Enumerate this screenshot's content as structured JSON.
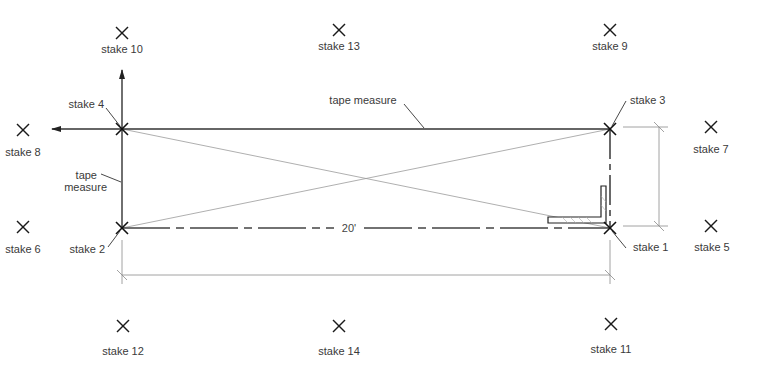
{
  "diagram": {
    "stakes": [
      {
        "id": "stake-1",
        "label": "stake 1",
        "role": "corner"
      },
      {
        "id": "stake-2",
        "label": "stake 2",
        "role": "corner"
      },
      {
        "id": "stake-3",
        "label": "stake 3",
        "role": "corner"
      },
      {
        "id": "stake-4",
        "label": "stake 4",
        "role": "corner"
      },
      {
        "id": "stake-5",
        "label": "stake 5",
        "role": "batter"
      },
      {
        "id": "stake-6",
        "label": "stake 6",
        "role": "batter"
      },
      {
        "id": "stake-7",
        "label": "stake 7",
        "role": "batter"
      },
      {
        "id": "stake-8",
        "label": "stake 8",
        "role": "batter"
      },
      {
        "id": "stake-9",
        "label": "stake 9",
        "role": "batter"
      },
      {
        "id": "stake-10",
        "label": "stake 10",
        "role": "batter"
      },
      {
        "id": "stake-11",
        "label": "stake 11",
        "role": "batter"
      },
      {
        "id": "stake-12",
        "label": "stake 12",
        "role": "batter"
      },
      {
        "id": "stake-13",
        "label": "stake 13",
        "role": "batter"
      },
      {
        "id": "stake-14",
        "label": "stake 14",
        "role": "batter"
      }
    ],
    "labels": {
      "tape_measure_top": "tape measure",
      "tape_measure_left_line1": "tape",
      "tape_measure_left_line2": "measure",
      "dimension": "20'"
    },
    "colors": {
      "line": "#333333",
      "diagonal": "#9a9a9a",
      "text": "#3a3a3a"
    }
  }
}
